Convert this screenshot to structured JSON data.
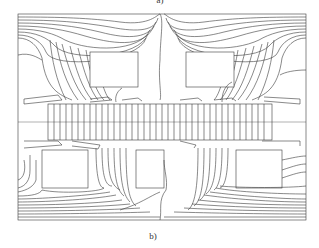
{
  "figure": {
    "caption_top": "a)",
    "caption_bottom": "b)",
    "line_color": "#3a3a3a",
    "background": "#ffffff"
  }
}
